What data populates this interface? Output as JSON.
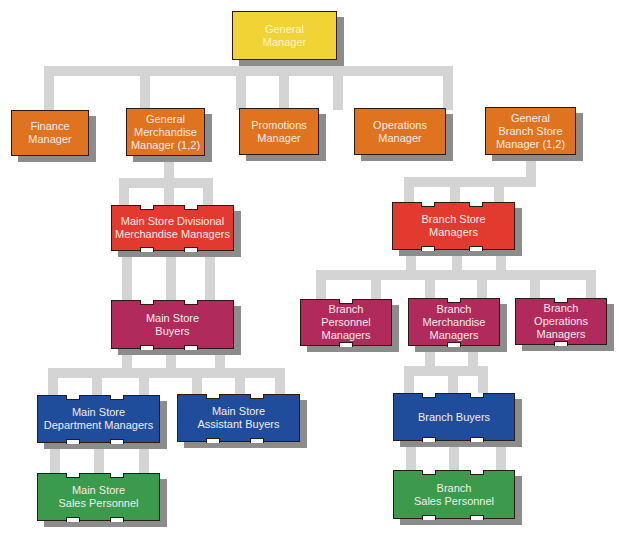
{
  "chart": {
    "type": "organization-chart",
    "colors": {
      "connector": "#d4d4d4",
      "level1": "#f2d335",
      "level2": "#e07320",
      "level3": "#e23a2e",
      "level4": "#b02a5c",
      "level5": "#1f4d9c",
      "level6": "#3b9a4c"
    },
    "nodes": {
      "general_manager": "General\nManager",
      "finance_manager": "Finance\nManager",
      "general_merchandise_manager": "General\nMerchandise\nManager (1,2)",
      "promotions_manager": "Promotions\nManager",
      "operations_manager": "Operations\nManager",
      "general_branch_store_manager": "General\nBranch Store\nManager (1,2)",
      "main_store_divisional_merchandise_managers": "Main Store Divisional\nMerchandise Managers",
      "main_store_buyers": "Main Store\nBuyers",
      "main_store_department_managers": "Main Store\nDepartment Managers",
      "main_store_assistant_buyers": "Main Store\nAssistant Buyers",
      "main_store_sales_personnel": "Main Store\nSales Personnel",
      "branch_store_managers": "Branch Store\nManagers",
      "branch_personnel_managers": "Branch\nPersonnel\nManagers",
      "branch_merchandise_managers": "Branch\nMerchandise\nManagers",
      "branch_operations_managers": "Branch\nOperations\nManagers",
      "branch_buyers": "Branch Buyers",
      "branch_sales_personnel": "Branch\nSales Personnel"
    }
  }
}
